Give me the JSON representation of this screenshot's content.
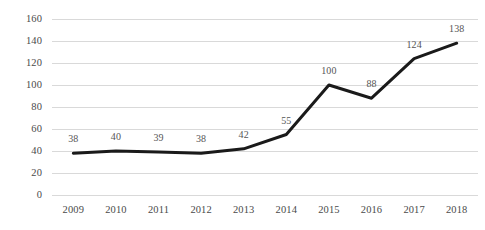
{
  "chart_data": {
    "type": "line",
    "title": "",
    "subtitle": "",
    "xlabel": "",
    "ylabel": "",
    "categories": [
      "2009",
      "2010",
      "2011",
      "2012",
      "2013",
      "2014",
      "2015",
      "2016",
      "2017",
      "2018"
    ],
    "values": [
      38,
      40,
      39,
      38,
      42,
      55,
      100,
      88,
      124,
      138
    ],
    "data_labels": [
      "38",
      "40",
      "39",
      "38",
      "42",
      "55",
      "100",
      "88",
      "124",
      "138"
    ],
    "ylim": [
      0,
      160
    ],
    "ytick_values": [
      0,
      20,
      40,
      60,
      80,
      100,
      120,
      140,
      160
    ],
    "ytick_labels": [
      "0",
      "20",
      "40",
      "60",
      "80",
      "100",
      "120",
      "140",
      "160"
    ],
    "grid": "horizontal",
    "legend": "none",
    "series": [
      {
        "name": "series-1",
        "values": [
          38,
          40,
          39,
          38,
          42,
          55,
          100,
          88,
          124,
          138
        ],
        "color": "#1a1a1a",
        "line_width": 3,
        "markers": false
      }
    ],
    "colors": {
      "line": "#1a1a1a",
      "gridline": "#d9d9d9",
      "tick_text": "#4a4a4a",
      "label_text": "#555555",
      "background": "#ffffff"
    }
  }
}
